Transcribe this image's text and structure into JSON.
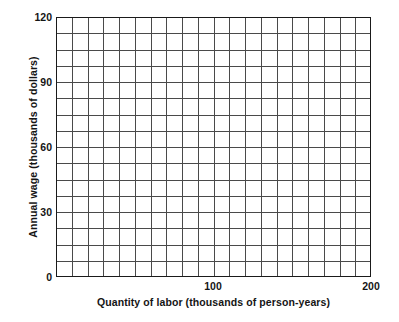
{
  "chart_data": {
    "type": "line",
    "title": "",
    "subtitle": "",
    "xlabel": "Quantity of labor (thousands of person-years)",
    "ylabel": "Annual wage (thousands of dollars)",
    "xlim": [
      0,
      200
    ],
    "ylim": [
      0,
      120
    ],
    "xticks": [
      100,
      200
    ],
    "xtick_labels": [
      "100",
      "200"
    ],
    "yticks": [
      0,
      30,
      60,
      90,
      120
    ],
    "ytick_labels": [
      "0",
      "30",
      "60",
      "90",
      "120"
    ],
    "grid": true,
    "grid_columns": 20,
    "grid_rows": 16,
    "grid_x_step": 10,
    "grid_y_step": 7.5,
    "legend": null,
    "legend_position": "none",
    "series": [],
    "annotations": [],
    "note": "Empty graph-paper style axes; no data plotted.",
    "colors": {
      "grid": "#4a4a4a",
      "axis": "#1a1a1a",
      "text": "#151515",
      "background": "#ffffff"
    }
  },
  "axes": {
    "y_tick_0": "0",
    "y_tick_1": "30",
    "y_tick_2": "60",
    "y_tick_3": "90",
    "y_tick_4": "120",
    "x_tick_0": "100",
    "x_tick_1": "200"
  },
  "labels": {
    "x_title": "Quantity of labor (thousands of person-years)",
    "y_title": "Annual wage (thousands of dollars)"
  }
}
